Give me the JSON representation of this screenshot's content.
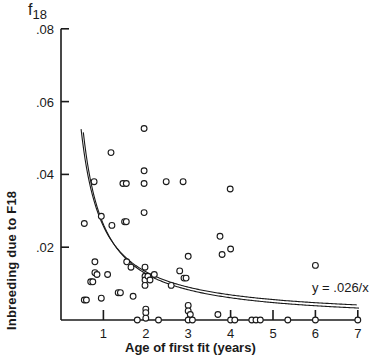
{
  "chart_data": {
    "type": "scatter",
    "title": "",
    "xlabel": "Age of first fit (years)",
    "ylabel": "Inbreeding due to F18",
    "y_symbol": "f",
    "y_symbol_sub": "18",
    "xlim": [
      0,
      7
    ],
    "ylim": [
      0,
      0.08
    ],
    "x_ticks": [
      1,
      2,
      3,
      4,
      5,
      6,
      7
    ],
    "x_tick_labels": [
      "1",
      "2",
      "3",
      "4",
      "5",
      "6",
      "7"
    ],
    "y_ticks": [
      0.02,
      0.04,
      0.06,
      0.08
    ],
    "y_tick_labels": [
      ".02",
      ".04",
      ".06",
      ".08"
    ],
    "grid": false,
    "curve": {
      "label": "y = .026/x",
      "formula": "y = 0.026 / x",
      "x_range": [
        0.5,
        7
      ],
      "style": "double line"
    },
    "points": [
      {
        "x": 0.55,
        "y": 0.0265
      },
      {
        "x": 0.55,
        "y": 0.0055
      },
      {
        "x": 0.6,
        "y": 0.0055
      },
      {
        "x": 0.7,
        "y": 0.0105
      },
      {
        "x": 0.75,
        "y": 0.0105
      },
      {
        "x": 0.78,
        "y": 0.038
      },
      {
        "x": 0.8,
        "y": 0.016
      },
      {
        "x": 0.8,
        "y": 0.013
      },
      {
        "x": 0.85,
        "y": 0.0125
      },
      {
        "x": 0.95,
        "y": 0.0285
      },
      {
        "x": 0.95,
        "y": 0.006
      },
      {
        "x": 1.1,
        "y": 0.0125
      },
      {
        "x": 1.18,
        "y": 0.046
      },
      {
        "x": 1.2,
        "y": 0.026
      },
      {
        "x": 1.35,
        "y": 0.0075
      },
      {
        "x": 1.4,
        "y": 0.0075
      },
      {
        "x": 1.46,
        "y": 0.0375
      },
      {
        "x": 1.5,
        "y": 0.027
      },
      {
        "x": 1.54,
        "y": 0.0375
      },
      {
        "x": 1.54,
        "y": 0.027
      },
      {
        "x": 1.55,
        "y": 0.016
      },
      {
        "x": 1.65,
        "y": 0.0145
      },
      {
        "x": 1.7,
        "y": 0.0065
      },
      {
        "x": 1.8,
        "y": 0.0
      },
      {
        "x": 1.96,
        "y": 0.0526
      },
      {
        "x": 1.96,
        "y": 0.041
      },
      {
        "x": 1.96,
        "y": 0.0375
      },
      {
        "x": 1.96,
        "y": 0.0295
      },
      {
        "x": 1.98,
        "y": 0.0145
      },
      {
        "x": 1.98,
        "y": 0.012
      },
      {
        "x": 1.98,
        "y": 0.011
      },
      {
        "x": 1.98,
        "y": 0.0095
      },
      {
        "x": 2.0,
        "y": 0.003
      },
      {
        "x": 2.0,
        "y": 0.002
      },
      {
        "x": 2.0,
        "y": 0.0005
      },
      {
        "x": 2.05,
        "y": 0.012
      },
      {
        "x": 2.1,
        "y": 0.011
      },
      {
        "x": 2.2,
        "y": 0.0125
      },
      {
        "x": 2.3,
        "y": 0.0
      },
      {
        "x": 2.48,
        "y": 0.038
      },
      {
        "x": 2.6,
        "y": 0.0095
      },
      {
        "x": 2.8,
        "y": 0.0135
      },
      {
        "x": 2.88,
        "y": 0.038
      },
      {
        "x": 2.9,
        "y": 0.0115
      },
      {
        "x": 2.95,
        "y": 0.0115
      },
      {
        "x": 3.0,
        "y": 0.0175
      },
      {
        "x": 3.0,
        "y": 0.004
      },
      {
        "x": 3.0,
        "y": 0.0025
      },
      {
        "x": 3.05,
        "y": 0.0015
      },
      {
        "x": 3.0,
        "y": 0.0
      },
      {
        "x": 3.1,
        "y": 0.0
      },
      {
        "x": 3.7,
        "y": 0.0015
      },
      {
        "x": 3.75,
        "y": 0.023
      },
      {
        "x": 3.8,
        "y": 0.018
      },
      {
        "x": 3.99,
        "y": 0.036
      },
      {
        "x": 4.0,
        "y": 0.0195
      },
      {
        "x": 4.0,
        "y": 0.0
      },
      {
        "x": 4.1,
        "y": 0.0
      },
      {
        "x": 4.5,
        "y": 0.0
      },
      {
        "x": 4.6,
        "y": 0.0
      },
      {
        "x": 4.7,
        "y": 0.0
      },
      {
        "x": 5.35,
        "y": 0.0
      },
      {
        "x": 6.0,
        "y": 0.015
      },
      {
        "x": 6.0,
        "y": 0.0
      },
      {
        "x": 7.0,
        "y": 0.0
      }
    ]
  }
}
